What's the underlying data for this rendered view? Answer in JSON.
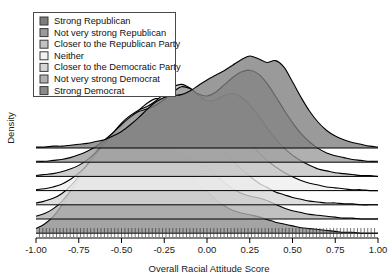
{
  "chart_data": {
    "type": "area",
    "title": "",
    "subtitle": "",
    "xlabel": "Overall Racial Attitude Score",
    "ylabel": "Density",
    "xlim": [
      -1.0,
      1.0
    ],
    "xticks": [
      -1.0,
      -0.75,
      -0.5,
      -0.25,
      0.0,
      0.25,
      0.5,
      0.75,
      1.0
    ],
    "xtick_labels": [
      "-1.00",
      "-0.75",
      "-0.50",
      "-0.25",
      "0.00",
      "0.25",
      "0.50",
      "0.75",
      "1.00"
    ],
    "ylim": [
      0,
      1
    ],
    "yticks": [],
    "ytick_labels": [],
    "grid": false,
    "legend_position": "top-left",
    "style": "ridgeline-overlapping-density",
    "rug": true,
    "series": [
      {
        "name": "Strong Republican",
        "color": "#7d7d7d",
        "baseline_index": 0,
        "x": [
          -1.0,
          -0.95,
          -0.9,
          -0.85,
          -0.8,
          -0.75,
          -0.7,
          -0.65,
          -0.6,
          -0.55,
          -0.5,
          -0.45,
          -0.4,
          -0.35,
          -0.3,
          -0.25,
          -0.2,
          -0.15,
          -0.1,
          -0.05,
          0.0,
          0.05,
          0.1,
          0.15,
          0.2,
          0.25,
          0.3,
          0.35,
          0.4,
          0.45,
          0.5,
          0.55,
          0.6,
          0.65,
          0.7,
          0.75,
          0.8,
          0.85,
          0.9,
          0.95,
          1.0
        ],
        "values": [
          0.01,
          0.01,
          0.02,
          0.02,
          0.03,
          0.04,
          0.05,
          0.07,
          0.09,
          0.13,
          0.18,
          0.25,
          0.33,
          0.42,
          0.5,
          0.55,
          0.57,
          0.58,
          0.62,
          0.68,
          0.74,
          0.79,
          0.84,
          0.9,
          0.96,
          1.0,
          0.97,
          0.93,
          0.95,
          0.88,
          0.72,
          0.55,
          0.4,
          0.28,
          0.19,
          0.13,
          0.09,
          0.06,
          0.04,
          0.02,
          0.01
        ]
      },
      {
        "name": "Not very strong Republican",
        "color": "#9a9a9a",
        "baseline_index": 1,
        "x": [
          -1.0,
          -0.95,
          -0.9,
          -0.85,
          -0.8,
          -0.75,
          -0.7,
          -0.65,
          -0.6,
          -0.55,
          -0.5,
          -0.45,
          -0.4,
          -0.35,
          -0.3,
          -0.25,
          -0.2,
          -0.15,
          -0.1,
          -0.05,
          0.0,
          0.05,
          0.1,
          0.15,
          0.2,
          0.25,
          0.3,
          0.35,
          0.4,
          0.45,
          0.5,
          0.55,
          0.6,
          0.65,
          0.7,
          0.75,
          0.8,
          0.85,
          0.9,
          0.95,
          1.0
        ],
        "values": [
          0.01,
          0.01,
          0.02,
          0.03,
          0.05,
          0.08,
          0.12,
          0.17,
          0.24,
          0.32,
          0.41,
          0.49,
          0.55,
          0.58,
          0.62,
          0.68,
          0.76,
          0.82,
          0.8,
          0.74,
          0.72,
          0.76,
          0.84,
          0.92,
          0.98,
          1.0,
          0.96,
          0.86,
          0.72,
          0.57,
          0.43,
          0.31,
          0.22,
          0.15,
          0.1,
          0.07,
          0.05,
          0.03,
          0.02,
          0.01,
          0.01
        ]
      },
      {
        "name": "Closer to the Republican Party",
        "color": "#c2c2c2",
        "baseline_index": 2,
        "x": [
          -1.0,
          -0.95,
          -0.9,
          -0.85,
          -0.8,
          -0.75,
          -0.7,
          -0.65,
          -0.6,
          -0.55,
          -0.5,
          -0.45,
          -0.4,
          -0.35,
          -0.3,
          -0.25,
          -0.2,
          -0.15,
          -0.1,
          -0.05,
          0.0,
          0.05,
          0.1,
          0.15,
          0.2,
          0.25,
          0.3,
          0.35,
          0.4,
          0.45,
          0.5,
          0.55,
          0.6,
          0.65,
          0.7,
          0.75,
          0.8,
          0.85,
          0.9,
          0.95,
          1.0
        ],
        "values": [
          0.01,
          0.02,
          0.03,
          0.05,
          0.08,
          0.12,
          0.18,
          0.26,
          0.36,
          0.47,
          0.58,
          0.66,
          0.72,
          0.76,
          0.82,
          0.9,
          0.97,
          1.0,
          0.96,
          0.88,
          0.82,
          0.83,
          0.88,
          0.9,
          0.86,
          0.78,
          0.66,
          0.53,
          0.41,
          0.31,
          0.23,
          0.17,
          0.12,
          0.08,
          0.06,
          0.04,
          0.03,
          0.02,
          0.01,
          0.01,
          0.0
        ]
      },
      {
        "name": "Neither",
        "color": "#eeeeee",
        "baseline_index": 3,
        "x": [
          -1.0,
          -0.95,
          -0.9,
          -0.85,
          -0.8,
          -0.75,
          -0.7,
          -0.65,
          -0.6,
          -0.55,
          -0.5,
          -0.45,
          -0.4,
          -0.35,
          -0.3,
          -0.25,
          -0.2,
          -0.15,
          -0.1,
          -0.05,
          0.0,
          0.05,
          0.1,
          0.15,
          0.2,
          0.25,
          0.3,
          0.35,
          0.4,
          0.45,
          0.5,
          0.55,
          0.6,
          0.65,
          0.7,
          0.75,
          0.8,
          0.85,
          0.9,
          0.95,
          1.0
        ],
        "values": [
          0.01,
          0.02,
          0.04,
          0.07,
          0.12,
          0.19,
          0.28,
          0.39,
          0.5,
          0.6,
          0.69,
          0.78,
          0.87,
          0.95,
          1.0,
          0.98,
          0.9,
          0.82,
          0.79,
          0.82,
          0.86,
          0.85,
          0.8,
          0.72,
          0.62,
          0.52,
          0.42,
          0.33,
          0.26,
          0.2,
          0.15,
          0.11,
          0.08,
          0.06,
          0.04,
          0.03,
          0.02,
          0.01,
          0.01,
          0.0,
          0.0
        ]
      },
      {
        "name": "Closer to the Democratic Party",
        "color": "#d6d6d6",
        "baseline_index": 4,
        "x": [
          -1.0,
          -0.95,
          -0.9,
          -0.85,
          -0.8,
          -0.75,
          -0.7,
          -0.65,
          -0.6,
          -0.55,
          -0.5,
          -0.45,
          -0.4,
          -0.35,
          -0.3,
          -0.25,
          -0.2,
          -0.15,
          -0.1,
          -0.05,
          0.0,
          0.05,
          0.1,
          0.15,
          0.2,
          0.25,
          0.3,
          0.35,
          0.4,
          0.45,
          0.5,
          0.55,
          0.6,
          0.65,
          0.7,
          0.75,
          0.8,
          0.85,
          0.9,
          0.95,
          1.0
        ],
        "values": [
          0.02,
          0.04,
          0.07,
          0.12,
          0.2,
          0.31,
          0.44,
          0.57,
          0.68,
          0.77,
          0.85,
          0.92,
          0.97,
          1.0,
          0.97,
          0.9,
          0.82,
          0.76,
          0.74,
          0.74,
          0.72,
          0.66,
          0.58,
          0.48,
          0.39,
          0.31,
          0.24,
          0.19,
          0.14,
          0.11,
          0.08,
          0.06,
          0.04,
          0.03,
          0.02,
          0.02,
          0.01,
          0.01,
          0.0,
          0.0,
          0.0
        ]
      },
      {
        "name": "Not very strong Democrat",
        "color": "#b0b0b0",
        "baseline_index": 5,
        "x": [
          -1.0,
          -0.95,
          -0.9,
          -0.85,
          -0.8,
          -0.75,
          -0.7,
          -0.65,
          -0.6,
          -0.55,
          -0.5,
          -0.45,
          -0.4,
          -0.35,
          -0.3,
          -0.25,
          -0.2,
          -0.15,
          -0.1,
          -0.05,
          0.0,
          0.05,
          0.1,
          0.15,
          0.2,
          0.25,
          0.3,
          0.35,
          0.4,
          0.45,
          0.5,
          0.55,
          0.6,
          0.65,
          0.7,
          0.75,
          0.8,
          0.85,
          0.9,
          0.95,
          1.0
        ],
        "values": [
          0.03,
          0.06,
          0.11,
          0.19,
          0.3,
          0.43,
          0.57,
          0.69,
          0.79,
          0.87,
          0.94,
          0.99,
          1.0,
          0.96,
          0.89,
          0.82,
          0.76,
          0.72,
          0.68,
          0.63,
          0.56,
          0.48,
          0.4,
          0.33,
          0.28,
          0.25,
          0.23,
          0.2,
          0.16,
          0.12,
          0.09,
          0.07,
          0.05,
          0.04,
          0.03,
          0.02,
          0.01,
          0.01,
          0.0,
          0.0,
          0.0
        ]
      },
      {
        "name": "Strong Democrat",
        "color": "#8a8a8a",
        "baseline_index": 6,
        "x": [
          -1.0,
          -0.95,
          -0.9,
          -0.85,
          -0.8,
          -0.75,
          -0.7,
          -0.65,
          -0.6,
          -0.55,
          -0.5,
          -0.45,
          -0.4,
          -0.35,
          -0.3,
          -0.25,
          -0.2,
          -0.15,
          -0.1,
          -0.05,
          0.0,
          0.05,
          0.1,
          0.15,
          0.2,
          0.25,
          0.3,
          0.35,
          0.4,
          0.45,
          0.5,
          0.55,
          0.6,
          0.65,
          0.7,
          0.75,
          0.8,
          0.85,
          0.9,
          0.95,
          1.0
        ],
        "values": [
          0.05,
          0.1,
          0.18,
          0.3,
          0.45,
          0.6,
          0.73,
          0.84,
          0.92,
          0.97,
          1.0,
          0.99,
          0.95,
          0.89,
          0.82,
          0.76,
          0.71,
          0.66,
          0.6,
          0.53,
          0.45,
          0.37,
          0.3,
          0.25,
          0.22,
          0.2,
          0.18,
          0.15,
          0.12,
          0.1,
          0.08,
          0.06,
          0.05,
          0.04,
          0.03,
          0.02,
          0.01,
          0.01,
          0.0,
          0.0,
          0.0
        ]
      }
    ],
    "rug_values": [
      -0.98,
      -0.96,
      -0.94,
      -0.92,
      -0.9,
      -0.88,
      -0.86,
      -0.84,
      -0.82,
      -0.8,
      -0.78,
      -0.76,
      -0.74,
      -0.72,
      -0.7,
      -0.68,
      -0.66,
      -0.64,
      -0.62,
      -0.6,
      -0.58,
      -0.56,
      -0.54,
      -0.52,
      -0.5,
      -0.48,
      -0.46,
      -0.44,
      -0.42,
      -0.4,
      -0.38,
      -0.36,
      -0.34,
      -0.32,
      -0.3,
      -0.28,
      -0.26,
      -0.24,
      -0.22,
      -0.2,
      -0.18,
      -0.16,
      -0.14,
      -0.12,
      -0.1,
      -0.08,
      -0.06,
      -0.04,
      -0.02,
      0.0,
      0.02,
      0.04,
      0.06,
      0.08,
      0.1,
      0.12,
      0.14,
      0.16,
      0.18,
      0.2,
      0.22,
      0.24,
      0.26,
      0.28,
      0.3,
      0.32,
      0.34,
      0.36,
      0.38,
      0.4,
      0.42,
      0.44,
      0.46,
      0.48,
      0.5,
      0.52,
      0.54,
      0.56,
      0.58,
      0.6,
      0.62,
      0.64,
      0.66,
      0.68,
      0.7,
      0.72,
      0.74,
      0.76,
      0.78,
      0.8,
      0.82,
      0.84,
      0.86,
      0.88,
      0.9,
      0.92,
      0.94,
      0.96,
      0.98
    ]
  },
  "legend": {
    "items": [
      {
        "label": "Strong Republican",
        "color": "#7d7d7d"
      },
      {
        "label": "Not very strong Republican",
        "color": "#9a9a9a"
      },
      {
        "label": "Closer to the Republican Party",
        "color": "#c2c2c2"
      },
      {
        "label": "Neither",
        "color": "#f2f2f2"
      },
      {
        "label": "Closer to the Democratic Party",
        "color": "#d6d6d6"
      },
      {
        "label": "Not very strong Democrat",
        "color": "#b0b0b0"
      },
      {
        "label": "Strong Democrat",
        "color": "#8a8a8a"
      }
    ]
  }
}
